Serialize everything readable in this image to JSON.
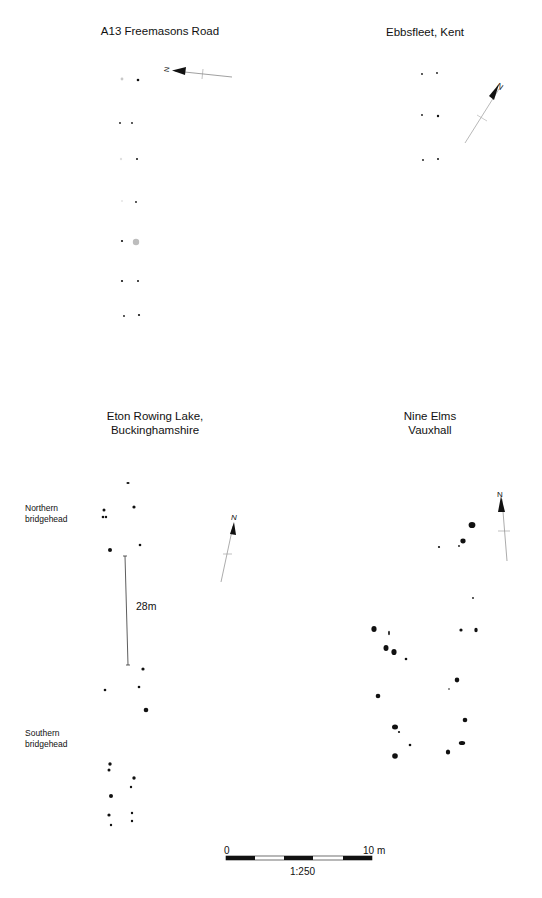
{
  "figure": {
    "panels": [
      {
        "id": "a13",
        "title": "A13 Freemasons Road",
        "north_label": "N"
      },
      {
        "id": "ebbsfleet",
        "title": "Ebbsfleet, Kent",
        "north_label": "N"
      },
      {
        "id": "eton",
        "title_line1": "Eton Rowing Lake,",
        "title_line2": "Buckinghamshire",
        "north_label": "N",
        "labels": {
          "northern_line1": "Northern",
          "northern_line2": "bridgehead",
          "southern_line1": "Southern",
          "southern_line2": "bridgehead",
          "span_distance": "28m"
        }
      },
      {
        "id": "nine_elms",
        "title_line1": "Nine Elms",
        "title_line2": "Vauxhall",
        "north_label": "N"
      }
    ],
    "scale_bar": {
      "start_label": "0",
      "end_label": "10 m",
      "ratio_label": "1:250"
    },
    "colors": {
      "ink": "#111111",
      "faded_post": "#bdbdbd",
      "arrow_line": "#888888"
    }
  }
}
